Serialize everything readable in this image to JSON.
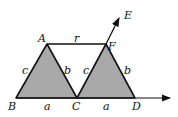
{
  "diagram": {
    "colors": {
      "fill": "#a9a9a9",
      "stroke": "#111111",
      "background": "#ffffff"
    },
    "points": {
      "A": {
        "label": "A",
        "x": 47,
        "y": 44
      },
      "B": {
        "label": "B",
        "x": 16,
        "y": 98
      },
      "C": {
        "label": "C",
        "x": 77,
        "y": 98
      },
      "D": {
        "label": "D",
        "x": 135,
        "y": 98
      },
      "E": {
        "label": "E",
        "x": 119,
        "y": 18
      },
      "F": {
        "label": "F",
        "x": 106,
        "y": 44
      }
    },
    "segment_labels": {
      "AF": "r",
      "AB": "c",
      "AC": "b",
      "FC": "c",
      "FD": "b",
      "BC": "a",
      "CD": "a"
    },
    "shapes": [
      {
        "name": "triangle-ABC",
        "fill": true
      },
      {
        "name": "triangle-FCD",
        "fill": true
      }
    ],
    "arrows": [
      {
        "name": "ray-FE",
        "from": "F",
        "to": "E"
      },
      {
        "name": "baseline-ray",
        "from": "B",
        "to_x": 170
      }
    ]
  }
}
